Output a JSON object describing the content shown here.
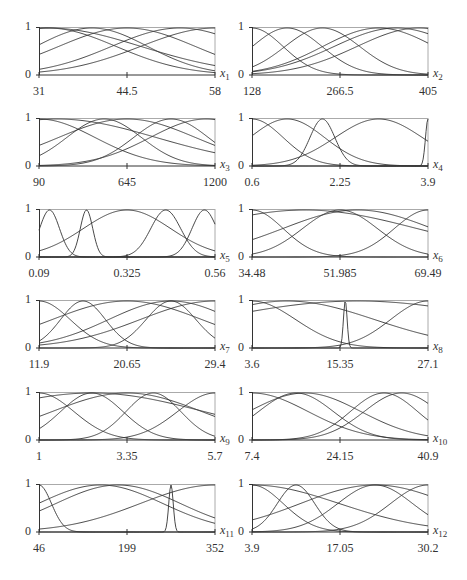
{
  "chart_data": [
    {
      "type": "line",
      "title": "",
      "variable": "x",
      "subscript": "1",
      "xlabel": "x1",
      "ylabel": "",
      "ylim": [
        0,
        1
      ],
      "x_ticks": [
        "31",
        "44.5",
        "58"
      ],
      "y_ticks": [
        "0",
        "1"
      ],
      "xmin": 31,
      "xmax": 58,
      "series": [
        {
          "name": "mf1",
          "shape": "gauss",
          "center": 0.05,
          "width": 0.55
        },
        {
          "name": "mf2",
          "shape": "gauss",
          "center": 0.3,
          "width": 0.45
        },
        {
          "name": "mf3",
          "shape": "gauss",
          "center": 0.5,
          "width": 0.55
        },
        {
          "name": "mf4",
          "shape": "gauss",
          "center": 0.8,
          "width": 0.55
        },
        {
          "name": "mf5",
          "shape": "gauss",
          "center": 1.0,
          "width": 0.6
        },
        {
          "name": "mf6",
          "shape": "gauss",
          "center": 0.05,
          "width": 0.75
        }
      ]
    },
    {
      "type": "line",
      "title": "",
      "variable": "x",
      "subscript": "2",
      "xlabel": "x2",
      "ylabel": "",
      "ylim": [
        0,
        1
      ],
      "x_ticks": [
        "128",
        "266.5",
        "405"
      ],
      "y_ticks": [
        "0",
        "1"
      ],
      "xmin": 128,
      "xmax": 405,
      "series": [
        {
          "name": "mf1",
          "shape": "gauss",
          "center": 0.0,
          "width": 0.25
        },
        {
          "name": "mf2",
          "shape": "gauss",
          "center": 0.2,
          "width": 0.28
        },
        {
          "name": "mf3",
          "shape": "gauss",
          "center": 0.4,
          "width": 0.3
        },
        {
          "name": "mf4",
          "shape": "gauss",
          "center": 0.72,
          "width": 0.45
        },
        {
          "name": "mf5",
          "shape": "gauss",
          "center": 0.82,
          "width": 0.5
        },
        {
          "name": "mf6",
          "shape": "gauss",
          "center": 0.95,
          "width": 0.5
        }
      ]
    },
    {
      "type": "line",
      "title": "",
      "variable": "x",
      "subscript": "3",
      "xlabel": "x3",
      "ylabel": "",
      "ylim": [
        0,
        1
      ],
      "x_ticks": [
        "90",
        "645",
        "1200"
      ],
      "y_ticks": [
        "0",
        "1"
      ],
      "xmin": 90,
      "xmax": 1200,
      "series": [
        {
          "name": "mf1",
          "shape": "gauss",
          "center": 0.0,
          "width": 0.45
        },
        {
          "name": "mf2",
          "shape": "gauss",
          "center": 0.37,
          "width": 0.3
        },
        {
          "name": "mf3",
          "shape": "gauss",
          "center": 0.5,
          "width": 0.55
        },
        {
          "name": "mf4",
          "shape": "gauss",
          "center": 0.75,
          "width": 0.3
        },
        {
          "name": "mf5",
          "shape": "gauss",
          "center": 0.95,
          "width": 0.45
        },
        {
          "name": "mf6",
          "shape": "gauss",
          "center": 0.1,
          "width": 0.8
        }
      ]
    },
    {
      "type": "line",
      "title": "",
      "variable": "x",
      "subscript": "4",
      "xlabel": "x4",
      "ylabel": "",
      "ylim": [
        0,
        1
      ],
      "x_ticks": [
        "0.6",
        "2.25",
        "3.9"
      ],
      "y_ticks": [
        "0",
        "1"
      ],
      "xmin": 0.6,
      "xmax": 3.9,
      "series": [
        {
          "name": "mf1",
          "shape": "gauss",
          "center": 0.0,
          "width": 0.25
        },
        {
          "name": "mf2",
          "shape": "gauss",
          "center": 0.2,
          "width": 0.3
        },
        {
          "name": "mf3",
          "shape": "gauss",
          "center": 0.4,
          "width": 0.1
        },
        {
          "name": "mf4",
          "shape": "gauss",
          "center": 0.72,
          "width": 0.35
        },
        {
          "name": "mf5",
          "shape": "gauss",
          "center": 1.0,
          "width": 0.02
        }
      ]
    },
    {
      "type": "line",
      "title": "",
      "variable": "x",
      "subscript": "5",
      "xlabel": "x5",
      "ylabel": "",
      "ylim": [
        0,
        1
      ],
      "x_ticks": [
        "0.09",
        "0.325",
        "0.56"
      ],
      "y_ticks": [
        "0",
        "1"
      ],
      "xmin": 0.09,
      "xmax": 0.56,
      "series": [
        {
          "name": "mf1",
          "shape": "gauss",
          "center": 0.06,
          "width": 0.08
        },
        {
          "name": "mf2",
          "shape": "gauss",
          "center": 0.27,
          "width": 0.05
        },
        {
          "name": "mf3",
          "shape": "gauss",
          "center": 0.5,
          "width": 0.35
        },
        {
          "name": "mf4",
          "shape": "gauss",
          "center": 0.72,
          "width": 0.12
        },
        {
          "name": "mf5",
          "shape": "gauss",
          "center": 0.94,
          "width": 0.1
        }
      ]
    },
    {
      "type": "line",
      "title": "",
      "variable": "x",
      "subscript": "6",
      "xlabel": "x6",
      "ylabel": "",
      "ylim": [
        0,
        1
      ],
      "x_ticks": [
        "34.48",
        "51.985",
        "69.49"
      ],
      "y_ticks": [
        "0",
        "1"
      ],
      "xmin": 34.48,
      "xmax": 69.49,
      "series": [
        {
          "name": "mf1",
          "shape": "gauss",
          "center": 0.0,
          "width": 0.25
        },
        {
          "name": "mf2",
          "shape": "gauss",
          "center": 0.5,
          "width": 0.3
        },
        {
          "name": "mf3",
          "shape": "gauss",
          "center": 1.0,
          "width": 0.27
        },
        {
          "name": "mf4",
          "shape": "gauss",
          "center": 0.3,
          "width": 0.9
        },
        {
          "name": "mf5",
          "shape": "gauss",
          "center": 0.6,
          "width": 0.6
        }
      ]
    },
    {
      "type": "line",
      "title": "",
      "variable": "x",
      "subscript": "7",
      "xlabel": "x7",
      "ylabel": "",
      "ylim": [
        0,
        1
      ],
      "x_ticks": [
        "11.9",
        "20.65",
        "29.4"
      ],
      "y_ticks": [
        "0",
        "1"
      ],
      "xmin": 11.9,
      "xmax": 29.4,
      "series": [
        {
          "name": "mf1",
          "shape": "gauss",
          "center": 0.0,
          "width": 0.25
        },
        {
          "name": "mf2",
          "shape": "gauss",
          "center": 0.25,
          "width": 0.18
        },
        {
          "name": "mf3",
          "shape": "gauss",
          "center": 0.5,
          "width": 0.6
        },
        {
          "name": "mf4",
          "shape": "gauss",
          "center": 0.75,
          "width": 0.2
        },
        {
          "name": "mf5",
          "shape": "gauss",
          "center": 0.75,
          "width": 0.5
        },
        {
          "name": "mf6",
          "shape": "gauss",
          "center": 1.0,
          "width": 0.6
        }
      ]
    },
    {
      "type": "line",
      "title": "",
      "variable": "x",
      "subscript": "8",
      "xlabel": "x8",
      "ylabel": "",
      "ylim": [
        0,
        1
      ],
      "x_ticks": [
        "3.6",
        "15.35",
        "27.1"
      ],
      "y_ticks": [
        "0",
        "1"
      ],
      "xmin": 3.6,
      "xmax": 27.1,
      "series": [
        {
          "name": "mf1",
          "shape": "gauss",
          "center": 0.0,
          "width": 0.35
        },
        {
          "name": "mf2",
          "shape": "gauss",
          "center": 0.2,
          "width": 0.7
        },
        {
          "name": "mf3",
          "shape": "gauss",
          "center": 0.53,
          "width": 0.015
        },
        {
          "name": "mf4",
          "shape": "gauss",
          "center": 1.0,
          "width": 0.3
        },
        {
          "name": "mf5",
          "shape": "gauss",
          "center": 0.6,
          "width": 1.2
        }
      ]
    },
    {
      "type": "line",
      "title": "",
      "variable": "x",
      "subscript": "9",
      "xlabel": "x9",
      "ylabel": "",
      "ylim": [
        0,
        1
      ],
      "x_ticks": [
        "1",
        "3.35",
        "5.7"
      ],
      "y_ticks": [
        "0",
        "1"
      ],
      "xmin": 1,
      "xmax": 5.7,
      "series": [
        {
          "name": "mf1",
          "shape": "gauss",
          "center": 0.0,
          "width": 0.28
        },
        {
          "name": "mf2",
          "shape": "gauss",
          "center": 0.3,
          "width": 0.25
        },
        {
          "name": "mf3",
          "shape": "gauss",
          "center": 0.5,
          "width": 0.6
        },
        {
          "name": "mf4",
          "shape": "gauss",
          "center": 0.65,
          "width": 0.22
        },
        {
          "name": "mf5",
          "shape": "gauss",
          "center": 1.0,
          "width": 0.3
        },
        {
          "name": "mf6",
          "shape": "gauss",
          "center": 0.3,
          "width": 0.9
        }
      ]
    },
    {
      "type": "line",
      "title": "",
      "variable": "x",
      "subscript": "10",
      "xlabel": "x10",
      "ylabel": "",
      "ylim": [
        0,
        1
      ],
      "x_ticks": [
        "7.4",
        "24.15",
        "40.9"
      ],
      "y_ticks": [
        "0",
        "1"
      ],
      "xmin": 7.4,
      "xmax": 40.9,
      "series": [
        {
          "name": "mf1",
          "shape": "gauss",
          "center": 0.0,
          "width": 0.45
        },
        {
          "name": "mf2",
          "shape": "gauss",
          "center": 0.25,
          "width": 0.3
        },
        {
          "name": "mf3",
          "shape": "gauss",
          "center": 0.3,
          "width": 0.45
        },
        {
          "name": "mf4",
          "shape": "gauss",
          "center": 0.75,
          "width": 0.27
        },
        {
          "name": "mf5",
          "shape": "gauss",
          "center": 0.85,
          "width": 0.3
        }
      ]
    },
    {
      "type": "line",
      "title": "",
      "variable": "x",
      "subscript": "11",
      "xlabel": "x11",
      "ylabel": "",
      "ylim": [
        0,
        1
      ],
      "x_ticks": [
        "46",
        "199",
        "352"
      ],
      "y_ticks": [
        "0",
        "1"
      ],
      "xmin": 46,
      "xmax": 352,
      "series": [
        {
          "name": "mf1",
          "shape": "gauss",
          "center": 0.0,
          "width": 0.1
        },
        {
          "name": "mf2",
          "shape": "gauss",
          "center": 0.35,
          "width": 0.5
        },
        {
          "name": "mf3",
          "shape": "gauss",
          "center": 0.75,
          "width": 0.018
        },
        {
          "name": "mf4",
          "shape": "gauss",
          "center": 1.0,
          "width": 0.6
        },
        {
          "name": "mf5",
          "shape": "gauss",
          "center": 0.45,
          "width": 0.5
        }
      ]
    },
    {
      "type": "line",
      "title": "",
      "variable": "x",
      "subscript": "12",
      "xlabel": "x12",
      "ylabel": "",
      "ylim": [
        0,
        1
      ],
      "x_ticks": [
        "3.9",
        "17.05",
        "30.2"
      ],
      "y_ticks": [
        "0",
        "1"
      ],
      "xmin": 3.9,
      "xmax": 30.2,
      "series": [
        {
          "name": "mf1",
          "shape": "gauss",
          "center": 0.0,
          "width": 0.25
        },
        {
          "name": "mf2",
          "shape": "gauss",
          "center": 0.25,
          "width": 0.15
        },
        {
          "name": "mf3",
          "shape": "gauss",
          "center": 0.7,
          "width": 0.6
        },
        {
          "name": "mf4",
          "shape": "gauss",
          "center": 0.7,
          "width": 0.3
        },
        {
          "name": "mf5",
          "shape": "gauss",
          "center": 1.0,
          "width": 0.3
        },
        {
          "name": "mf6",
          "shape": "gauss",
          "center": 0.0,
          "width": 0.7
        }
      ]
    }
  ]
}
